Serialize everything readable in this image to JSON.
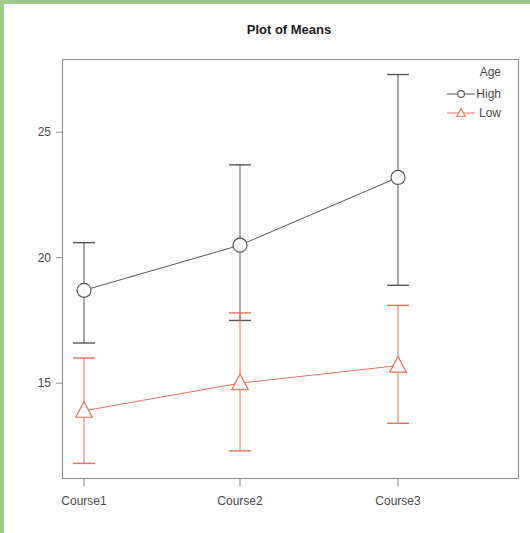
{
  "figure": {
    "border_color": "#9ec78a",
    "background": "#ffffff",
    "plot_frame_color": "#8a8a8a"
  },
  "chart_data": {
    "type": "line",
    "title": "Plot of Means",
    "xlabel": "",
    "ylabel": "",
    "categories": [
      "Course1",
      "Course2",
      "Course3"
    ],
    "ylim": [
      11.2,
      27.9
    ],
    "yticks": [
      15,
      20,
      25
    ],
    "ytick_labels": [
      "15",
      "20",
      "25"
    ],
    "grid": false,
    "legend": {
      "title": "Age",
      "position": "top-right-inside",
      "entries": [
        {
          "name": "High",
          "color": "#555555",
          "marker": "circle"
        },
        {
          "name": "Low",
          "color": "#e8705a",
          "marker": "triangle"
        }
      ]
    },
    "series": [
      {
        "name": "High",
        "color": "#555555",
        "marker": "circle",
        "values": [
          18.7,
          20.5,
          23.2
        ],
        "error_low": [
          16.6,
          17.5,
          18.9
        ],
        "error_high": [
          20.6,
          23.7,
          27.3
        ]
      },
      {
        "name": "Low",
        "color": "#e8705a",
        "marker": "triangle",
        "values": [
          13.9,
          15.0,
          15.7
        ],
        "error_low": [
          11.8,
          12.3,
          13.4
        ],
        "error_high": [
          16.0,
          17.8,
          18.1
        ]
      }
    ]
  }
}
